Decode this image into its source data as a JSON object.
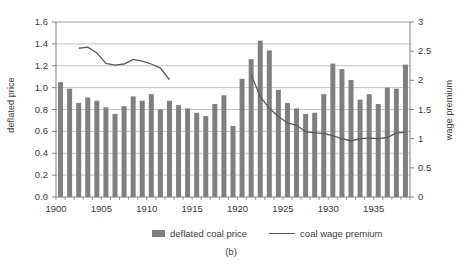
{
  "chart_data": {
    "type": "bar",
    "title": "",
    "caption": "(b)",
    "xlabel": "",
    "ylabel": "deflated price",
    "y2label": "wage premium",
    "x": [
      1900,
      1901,
      1902,
      1903,
      1904,
      1905,
      1906,
      1907,
      1908,
      1909,
      1910,
      1911,
      1912,
      1913,
      1914,
      1915,
      1916,
      1917,
      1918,
      1919,
      1920,
      1921,
      1922,
      1923,
      1924,
      1925,
      1926,
      1927,
      1928,
      1929,
      1930,
      1931,
      1932,
      1933,
      1934,
      1935,
      1936,
      1937,
      1938
    ],
    "xticks": [
      1900,
      1905,
      1910,
      1915,
      1920,
      1925,
      1930,
      1935
    ],
    "xlim": [
      1899.5,
      1938.5
    ],
    "yticks": [
      0.0,
      0.2,
      0.4,
      0.6,
      0.8,
      1.0,
      1.2,
      1.4,
      1.6
    ],
    "ylim": [
      0.0,
      1.6
    ],
    "y2ticks": [
      0,
      0.5,
      1,
      1.5,
      2,
      2.5,
      3
    ],
    "y2lim": [
      0,
      3
    ],
    "grid": true,
    "legend_position": "bottom",
    "series": [
      {
        "name": "deflated coal price",
        "kind": "bar",
        "axis": "left",
        "color": "#7f7f7f",
        "values": [
          1.05,
          0.99,
          0.86,
          0.91,
          0.88,
          0.82,
          0.76,
          0.83,
          0.92,
          0.88,
          0.94,
          0.8,
          0.88,
          0.84,
          0.81,
          0.77,
          0.74,
          0.85,
          0.93,
          0.65,
          1.08,
          1.26,
          1.43,
          1.34,
          0.98,
          0.86,
          0.81,
          0.76,
          0.77,
          0.94,
          1.22,
          1.17,
          1.07,
          0.89,
          0.94,
          0.85,
          1.0,
          0.99,
          1.21
        ]
      },
      {
        "name": "coal wage premium",
        "kind": "line",
        "axis": "right",
        "color": "#595959",
        "segments": [
          {
            "x": [
              1902,
              1903,
              1904,
              1905,
              1906,
              1907,
              1908,
              1909,
              1910,
              1911,
              1912
            ],
            "values": [
              2.55,
              2.57,
              2.47,
              2.29,
              2.26,
              2.28,
              2.36,
              2.33,
              2.28,
              2.21,
              2.01
            ]
          },
          {
            "x": [
              1921,
              1922,
              1923,
              1924,
              1925,
              1926,
              1927,
              1928,
              1929,
              1930,
              1931,
              1932,
              1933,
              1934,
              1935,
              1936,
              1937,
              1938
            ],
            "values": [
              2.1,
              1.72,
              1.52,
              1.38,
              1.27,
              1.23,
              1.12,
              1.1,
              1.09,
              1.05,
              1.0,
              0.96,
              1.0,
              1.01,
              1.0,
              1.02,
              1.1,
              1.11
            ]
          }
        ]
      }
    ]
  },
  "legend": {
    "items": [
      {
        "label": "deflated coal price",
        "marker": "bar-swatch"
      },
      {
        "label": "coal wage premium",
        "marker": "line-swatch"
      }
    ]
  },
  "axes": {
    "left_title": "deflated price",
    "right_title": "wage premium"
  },
  "caption": "(b)"
}
